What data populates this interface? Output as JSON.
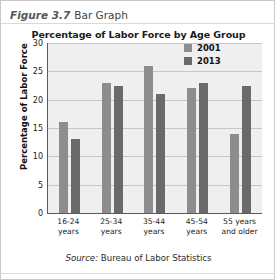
{
  "caption": {
    "figure_number": "Figure 3.7",
    "figure_title": "Bar Graph"
  },
  "source": {
    "label": "Source:",
    "text": "Bureau of Labor Statistics"
  },
  "chart_data": {
    "type": "bar",
    "title": "Percentage of Labor Force by Age Group",
    "xlabel": "",
    "ylabel": "Percentage of Labor Force",
    "ylim": [
      0,
      30
    ],
    "yticks": [
      0,
      5,
      10,
      15,
      20,
      25,
      30
    ],
    "ytick_labels": [
      "0",
      "5",
      "10",
      "15",
      "20",
      "25",
      "30"
    ],
    "grid": true,
    "legend_position": "top-right",
    "categories": [
      "16-24 years",
      "25-34 years",
      "35-44 years",
      "45-54 years",
      "55 years and older"
    ],
    "category_lines": [
      [
        "16-24",
        "years"
      ],
      [
        "25-34",
        "years"
      ],
      [
        "35-44",
        "years"
      ],
      [
        "45-54",
        "years"
      ],
      [
        "55 years",
        "and older"
      ]
    ],
    "series": [
      {
        "name": "2001",
        "color": "#8d8d8d",
        "values": [
          16,
          23,
          26,
          22,
          14
        ]
      },
      {
        "name": "2013",
        "color": "#6a6a6a",
        "values": [
          13,
          22.5,
          21,
          23,
          22.5
        ]
      }
    ]
  }
}
